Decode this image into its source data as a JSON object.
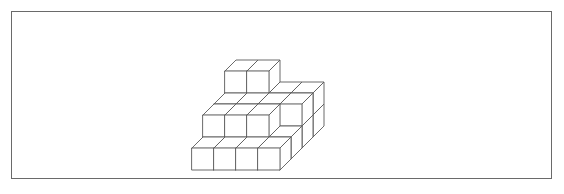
{
  "figure": {
    "kind": "isometric-cube-stack-line-drawing",
    "background_color": "#ffffff",
    "border_color": "#6a6a6a",
    "line_color": "#5a5a5a",
    "face_fill_color": "#ffffff",
    "frame": {
      "x": 11,
      "y": 11,
      "width": 541,
      "height": 168,
      "border_width": 1
    },
    "canvas": {
      "width": 564,
      "height": 194
    },
    "projection": {
      "type": "isometric-axonometric",
      "cube_face_width": 22,
      "cube_face_height": 22,
      "depth_dx": 11,
      "depth_dy": -11,
      "origin_x": 192,
      "origin_y": 170
    },
    "grid": {
      "columns": 4,
      "rows": 4,
      "max_height": 3
    },
    "note": "Heights map: heights[row][col] = number of stacked cubes at that grid cell; row 0 is frontmost, col 0 is leftmost.",
    "heights": [
      [
        1,
        1,
        1,
        1
      ],
      [
        2,
        2,
        2,
        1
      ],
      [
        2,
        2,
        2,
        2
      ],
      [
        3,
        3,
        2,
        2
      ]
    ],
    "total_cubes": 29
  }
}
